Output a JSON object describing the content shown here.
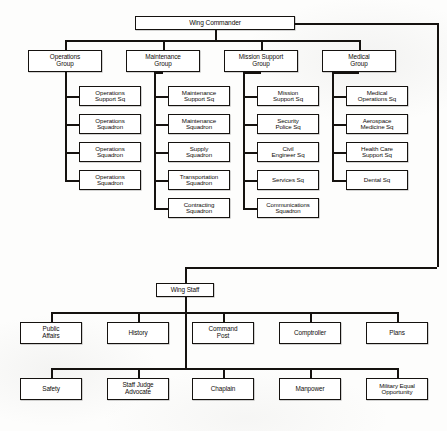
{
  "chart_data": {
    "type": "diagram",
    "diagram_kind": "organization-hierarchy",
    "root": "Wing Commander",
    "levels": [
      "Wing Commander",
      "Groups",
      "Squadrons",
      "Wing Staff",
      "Staff Offices"
    ]
  },
  "nodes": {
    "wing_commander": {
      "label": "Wing Commander",
      "x": 135,
      "y": 16,
      "w": 160,
      "h": 14,
      "fs": 6.6
    },
    "operations_group": {
      "label": "Operations\nGroup",
      "x": 28,
      "y": 50,
      "w": 74,
      "h": 22,
      "fs": 6.4
    },
    "maintenance_group": {
      "label": "Maintenance\nGroup",
      "x": 126,
      "y": 50,
      "w": 74,
      "h": 22,
      "fs": 6.4
    },
    "mission_support_group": {
      "label": "Mission Support\nGroup",
      "x": 224,
      "y": 50,
      "w": 74,
      "h": 22,
      "fs": 6.4
    },
    "medical_group": {
      "label": "Medical\nGroup",
      "x": 322,
      "y": 50,
      "w": 74,
      "h": 22,
      "fs": 6.4
    },
    "ops_sq_1": {
      "label": "Operations\nSupport Sq",
      "x": 79,
      "y": 86,
      "w": 62,
      "h": 20,
      "fs": 6.2
    },
    "ops_sq_2": {
      "label": "Operations\nSquadron",
      "x": 79,
      "y": 114,
      "w": 62,
      "h": 20,
      "fs": 6.2
    },
    "ops_sq_3": {
      "label": "Operations\nSquadron",
      "x": 79,
      "y": 142,
      "w": 62,
      "h": 20,
      "fs": 6.2
    },
    "ops_sq_4": {
      "label": "Operations\nSquadron",
      "x": 79,
      "y": 170,
      "w": 62,
      "h": 20,
      "fs": 6.2
    },
    "mx_sq_1": {
      "label": "Maintenance\nSupport Sq",
      "x": 168,
      "y": 86,
      "w": 62,
      "h": 20,
      "fs": 6.2
    },
    "mx_sq_2": {
      "label": "Maintenance\nSquadron",
      "x": 168,
      "y": 114,
      "w": 62,
      "h": 20,
      "fs": 6.2
    },
    "mx_sq_3": {
      "label": "Supply\nSquadron",
      "x": 168,
      "y": 142,
      "w": 62,
      "h": 20,
      "fs": 6.2
    },
    "mx_sq_4": {
      "label": "Transportation\nSquadron",
      "x": 168,
      "y": 170,
      "w": 62,
      "h": 20,
      "fs": 6.2
    },
    "mx_sq_5": {
      "label": "Contracting\nSquadron",
      "x": 168,
      "y": 198,
      "w": 62,
      "h": 20,
      "fs": 6.2
    },
    "ms_sq_1": {
      "label": "Mission\nSupport Sq",
      "x": 257,
      "y": 86,
      "w": 62,
      "h": 20,
      "fs": 6.2
    },
    "ms_sq_2": {
      "label": "Security\nPolice Sq",
      "x": 257,
      "y": 114,
      "w": 62,
      "h": 20,
      "fs": 6.2
    },
    "ms_sq_3": {
      "label": "Civil\nEngineer Sq",
      "x": 257,
      "y": 142,
      "w": 62,
      "h": 20,
      "fs": 6.2
    },
    "ms_sq_4": {
      "label": "Services Sq",
      "x": 257,
      "y": 170,
      "w": 62,
      "h": 20,
      "fs": 6.2
    },
    "ms_sq_5": {
      "label": "Communications\nSquadron",
      "x": 257,
      "y": 198,
      "w": 62,
      "h": 20,
      "fs": 6.0
    },
    "med_sq_1": {
      "label": "Medical\nOperations Sq",
      "x": 346,
      "y": 86,
      "w": 62,
      "h": 20,
      "fs": 6.2
    },
    "med_sq_2": {
      "label": "Aerospace\nMedicine Sq",
      "x": 346,
      "y": 114,
      "w": 62,
      "h": 20,
      "fs": 6.2
    },
    "med_sq_3": {
      "label": "Health Care\nSupport Sq",
      "x": 346,
      "y": 142,
      "w": 62,
      "h": 20,
      "fs": 6.2
    },
    "med_sq_4": {
      "label": "Dental Sq",
      "x": 346,
      "y": 170,
      "w": 62,
      "h": 20,
      "fs": 6.2
    },
    "wing_staff": {
      "label": "Wing Staff",
      "x": 156,
      "y": 283,
      "w": 58,
      "h": 14,
      "fs": 6.4
    },
    "public_affairs": {
      "label": "Public\nAffairs",
      "x": 20,
      "y": 322,
      "w": 62,
      "h": 22,
      "fs": 6.4
    },
    "history": {
      "label": "History",
      "x": 107,
      "y": 322,
      "w": 62,
      "h": 22,
      "fs": 6.4
    },
    "command_post": {
      "label": "Command\nPost",
      "x": 192,
      "y": 322,
      "w": 62,
      "h": 22,
      "fs": 6.4
    },
    "comptroller": {
      "label": "Comptroller",
      "x": 279,
      "y": 322,
      "w": 62,
      "h": 22,
      "fs": 6.4
    },
    "plans": {
      "label": "Plans",
      "x": 366,
      "y": 322,
      "w": 62,
      "h": 22,
      "fs": 6.4
    },
    "safety": {
      "label": "Safety",
      "x": 20,
      "y": 378,
      "w": 62,
      "h": 22,
      "fs": 6.4
    },
    "staff_judge": {
      "label": "Staff Judge\nAdvocate",
      "x": 107,
      "y": 378,
      "w": 62,
      "h": 22,
      "fs": 6.4
    },
    "chaplain": {
      "label": "Chaplain",
      "x": 192,
      "y": 378,
      "w": 62,
      "h": 22,
      "fs": 6.4
    },
    "manpower": {
      "label": "Manpower",
      "x": 279,
      "y": 378,
      "w": 62,
      "h": 22,
      "fs": 6.4
    },
    "military_equal_opp": {
      "label": "Military Equal\nOpportunity",
      "x": 366,
      "y": 378,
      "w": 62,
      "h": 22,
      "fs": 6.2
    }
  }
}
